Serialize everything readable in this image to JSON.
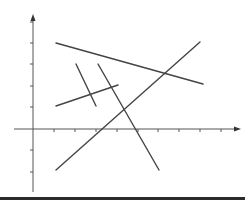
{
  "diagram": {
    "colors": {
      "axis": "#555555",
      "line": "#444444",
      "rule": "#2b2b2b",
      "background": "#ffffff"
    },
    "axes": {
      "origin": [
        33,
        129
      ],
      "x_axis": {
        "from": [
          14,
          129
        ],
        "to": [
          241,
          129
        ],
        "ticks_x": [
          54,
          75,
          96,
          117,
          138,
          158,
          179,
          200,
          221
        ]
      },
      "y_axis": {
        "from": [
          33,
          192
        ],
        "to": [
          33,
          14
        ],
        "ticks_y": [
          22,
          43,
          64,
          86,
          107,
          150,
          172
        ]
      }
    },
    "segments": [
      {
        "id": "a",
        "from": [
          56,
          43
        ],
        "to": [
          203,
          84
        ]
      },
      {
        "id": "b",
        "from": [
          56,
          170
        ],
        "to": [
          200,
          42
        ]
      },
      {
        "id": "c",
        "from": [
          76,
          64
        ],
        "to": [
          96,
          106
        ]
      },
      {
        "id": "d",
        "from": [
          98,
          64
        ],
        "to": [
          159,
          170
        ]
      },
      {
        "id": "e",
        "from": [
          56,
          106
        ],
        "to": [
          118,
          85
        ]
      }
    ]
  }
}
